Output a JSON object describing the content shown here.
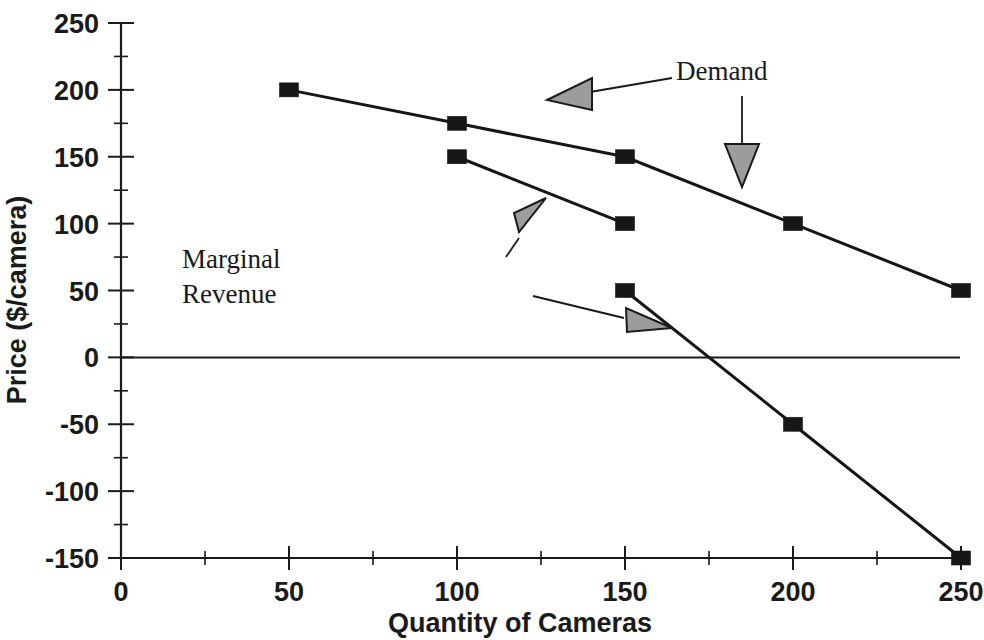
{
  "chart_data": {
    "type": "line",
    "title": "",
    "xlabel": "Quantity of Cameras",
    "ylabel": "Price ($/camera)",
    "xlim": [
      0,
      250
    ],
    "ylim": [
      -150,
      250
    ],
    "grid": false,
    "legend_position": "none",
    "x_major_ticks": [
      0,
      50,
      100,
      150,
      200,
      250
    ],
    "x_tick_labels": [
      "0",
      "50",
      "100",
      "150",
      "200",
      "250"
    ],
    "x_minor_ticks": [
      25,
      75,
      125,
      175,
      225
    ],
    "y_major_ticks": [
      250,
      200,
      150,
      100,
      50,
      0,
      -50,
      -100,
      -150
    ],
    "y_tick_labels": [
      "250",
      "200",
      "150",
      "100",
      "50",
      "0",
      "-50",
      "-100",
      "-150"
    ],
    "y_minor_ticks": [
      225,
      175,
      125,
      75,
      25,
      -25,
      -75,
      -125
    ],
    "series": [
      {
        "name": "Demand",
        "x": [
          50,
          100,
          150,
          200,
          250
        ],
        "values": [
          200,
          175,
          150,
          100,
          50
        ],
        "marker": "filled-square",
        "color": "#161616"
      },
      {
        "name": "Marginal Revenue",
        "x": [
          100,
          150
        ],
        "values": [
          150,
          100
        ],
        "marker": "filled-square",
        "color": "#161616"
      },
      {
        "name": "Marginal Revenue (lower)",
        "x": [
          150,
          200,
          250
        ],
        "values": [
          50,
          -50,
          -150
        ],
        "marker": "filled-square",
        "color": "#161616"
      }
    ],
    "annotations": [
      {
        "label": "Demand",
        "arrows": 2
      },
      {
        "label_line_1": "Marginal",
        "label_line_2": "Revenue",
        "arrows": 2
      }
    ],
    "colors": {
      "line": "#161616",
      "axis": "#1a1a1a",
      "arrow_fill": "#9c9c9c",
      "background": "#ffffff"
    }
  },
  "annotations": {
    "demand": "Demand",
    "marginal_line1": "Marginal",
    "marginal_line2": "Revenue"
  },
  "axes": {
    "x_title": "Quantity of Cameras",
    "y_title": "Price ($/camera)"
  }
}
